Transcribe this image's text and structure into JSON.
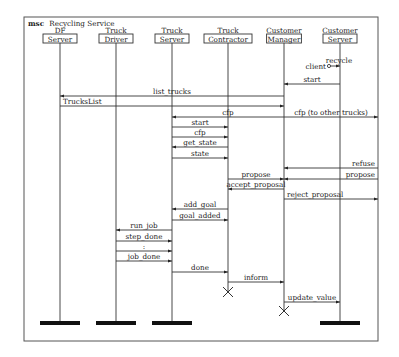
{
  "diagram": {
    "keyword": "msc",
    "title": "Recycling Service",
    "frame": {
      "x": 24,
      "y": 17,
      "w": 354,
      "h": 324
    },
    "instances": [
      {
        "id": "df",
        "line1": "DF",
        "line2": "Server",
        "x": 60,
        "end": "bar"
      },
      {
        "id": "td",
        "line1": "Truck",
        "line2": "Driver",
        "x": 116,
        "end": "bar"
      },
      {
        "id": "ts",
        "line1": "Truck",
        "line2": "Server",
        "x": 172,
        "end": "bar"
      },
      {
        "id": "tc",
        "line1": "Truck",
        "line2": "Contractor",
        "x": 228,
        "end": "cross",
        "end_y": 292
      },
      {
        "id": "cm",
        "line1": "Customer",
        "line2": "Manager",
        "x": 284,
        "end": "cross",
        "end_y": 311
      },
      {
        "id": "cs",
        "line1": "Customer",
        "line2": "Server",
        "x": 340,
        "end": "bar"
      }
    ],
    "end_bar_y": 322,
    "found_message": {
      "label_top": "recycle",
      "label_left": "client",
      "to": "cs",
      "y": 66
    },
    "messages": [
      {
        "label": "start",
        "from": "cs",
        "to": "cm",
        "y": 84
      },
      {
        "label": "list_trucks",
        "from": "cm",
        "to": "df",
        "y": 96
      },
      {
        "label": "TrucksList",
        "from": "df",
        "to": "cm",
        "y": 106,
        "label_align": "left"
      },
      {
        "label": "cfp",
        "from": "cm",
        "to": "ts",
        "y": 117
      },
      {
        "label": "cfp (to other trucks)",
        "from": "cm",
        "to": "env_right",
        "y": 117
      },
      {
        "label": "start",
        "from": "ts",
        "to": "tc",
        "y": 127
      },
      {
        "label": "cfp",
        "from": "ts",
        "to": "tc",
        "y": 137
      },
      {
        "label": "get_state",
        "from": "tc",
        "to": "ts",
        "y": 147
      },
      {
        "label": "state",
        "from": "ts",
        "to": "tc",
        "y": 158
      },
      {
        "label": "refuse",
        "from": "env_right",
        "to": "cm",
        "y": 168,
        "label_align": "right"
      },
      {
        "label": "propose",
        "from": "env_right",
        "to": "cm",
        "y": 179,
        "label_align": "right"
      },
      {
        "label": "propose",
        "from": "tc",
        "to": "cm",
        "y": 179
      },
      {
        "label": "accept_proposal",
        "from": "cm",
        "to": "tc",
        "y": 189
      },
      {
        "label": "reject_proposal",
        "from": "cm",
        "to": "env_right",
        "y": 199,
        "label_align": "left"
      },
      {
        "label": "add_goal",
        "from": "tc",
        "to": "ts",
        "y": 209
      },
      {
        "label": "goal_added",
        "from": "ts",
        "to": "tc",
        "y": 220
      },
      {
        "label": "run_job",
        "from": "ts",
        "to": "td",
        "y": 230
      },
      {
        "label": "step_done",
        "from": "td",
        "to": "ts",
        "y": 241
      },
      {
        "label": ":",
        "from": "td",
        "to": "ts",
        "y": 251
      },
      {
        "label": "job_done",
        "from": "td",
        "to": "ts",
        "y": 261
      },
      {
        "label": "done",
        "from": "ts",
        "to": "tc",
        "y": 272
      },
      {
        "label": "inform",
        "from": "tc",
        "to": "cm",
        "y": 282
      },
      {
        "label": "update_value",
        "from": "cm",
        "to": "cs",
        "y": 302
      }
    ]
  }
}
